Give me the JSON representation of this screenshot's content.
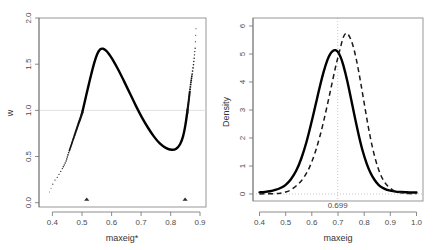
{
  "figure": {
    "background": "#ffffff",
    "panels": 2
  },
  "chart_data": [
    {
      "id": "left-panel",
      "type": "line",
      "title": "",
      "xlabel": "maxeig*",
      "ylabel": "w",
      "xlim": [
        0.355,
        0.915
      ],
      "ylim": [
        -0.07,
        2.07
      ],
      "xticks": [
        "0.4",
        "0.5",
        "0.6",
        "0.7",
        "0.8",
        "0.9"
      ],
      "xtick_values": [
        0.4,
        0.5,
        0.6,
        0.7,
        0.8,
        0.9
      ],
      "yticks": [
        "0.0",
        "0.5",
        "1.0",
        "1.5",
        "2.0"
      ],
      "ytick_values": [
        0.0,
        0.5,
        1.0,
        1.5,
        2.0
      ],
      "grid": false,
      "legend": "none",
      "reference_lines": [
        {
          "orientation": "horizontal",
          "value": 1.0,
          "color": "#d9d9d9",
          "style": "solid"
        }
      ],
      "series": [
        {
          "name": "w",
          "style": "dotted-to-solid",
          "color": "#000000",
          "x": [
            0.39,
            0.398,
            0.406,
            0.414,
            0.422,
            0.43,
            0.438,
            0.446,
            0.452,
            0.458,
            0.464,
            0.47,
            0.476,
            0.482,
            0.488,
            0.494,
            0.5,
            0.51,
            0.52,
            0.53,
            0.54,
            0.55,
            0.56,
            0.57,
            0.58,
            0.59,
            0.6,
            0.62,
            0.64,
            0.66,
            0.68,
            0.7,
            0.72,
            0.74,
            0.76,
            0.78,
            0.8,
            0.815,
            0.828,
            0.838,
            0.846,
            0.852,
            0.857,
            0.861,
            0.864,
            0.867,
            0.87,
            0.873,
            0.876,
            0.879,
            0.882
          ],
          "y": [
            0.1,
            0.165,
            0.225,
            0.255,
            0.3,
            0.345,
            0.395,
            0.45,
            0.52,
            0.58,
            0.64,
            0.7,
            0.76,
            0.82,
            0.88,
            0.935,
            1.0,
            1.145,
            1.29,
            1.43,
            1.56,
            1.66,
            1.715,
            1.722,
            1.7,
            1.66,
            1.61,
            1.49,
            1.355,
            1.215,
            1.075,
            0.945,
            0.83,
            0.73,
            0.65,
            0.6,
            0.578,
            0.59,
            0.64,
            0.73,
            0.86,
            1.0,
            1.13,
            1.25,
            1.33,
            1.4,
            1.47,
            1.54,
            1.64,
            1.74,
            2.01
          ]
        }
      ],
      "markers": [
        {
          "name": "rug-triangle",
          "x": 0.515,
          "y": 0.0,
          "shape": "triangle"
        },
        {
          "name": "rug-triangle",
          "x": 0.845,
          "y": 0.0,
          "shape": "triangle"
        }
      ]
    },
    {
      "id": "right-panel",
      "type": "line",
      "title": "",
      "xlabel": "maxeig",
      "ylabel": "Density",
      "xlim": [
        0.375,
        1.025
      ],
      "ylim": [
        -0.25,
        6.3
      ],
      "xticks": [
        "0.4",
        "0.5",
        "0.6",
        "0.7",
        "0.8",
        "0.9",
        "1.0"
      ],
      "xtick_values": [
        0.4,
        0.5,
        0.6,
        0.7,
        0.8,
        0.9,
        1.0
      ],
      "yticks": [
        "0",
        "1",
        "2",
        "3",
        "4",
        "5",
        "6"
      ],
      "ytick_values": [
        0,
        1,
        2,
        3,
        4,
        5,
        6
      ],
      "grid": false,
      "legend": "none",
      "annotations": [
        {
          "text": "0.699",
          "x": 0.699,
          "y": -0.2
        }
      ],
      "reference_lines": [
        {
          "orientation": "vertical",
          "value": 0.699,
          "color": "#b0b0b0",
          "style": "dotted"
        },
        {
          "orientation": "horizontal",
          "value": 0.0,
          "color": "#b0b0b0",
          "style": "dotted"
        }
      ],
      "series": [
        {
          "name": "density-observed",
          "style": "solid",
          "color": "#000000",
          "x": [
            0.4,
            0.42,
            0.44,
            0.46,
            0.48,
            0.5,
            0.52,
            0.54,
            0.56,
            0.58,
            0.6,
            0.615,
            0.63,
            0.645,
            0.66,
            0.67,
            0.68,
            0.69,
            0.7,
            0.71,
            0.72,
            0.735,
            0.75,
            0.765,
            0.78,
            0.795,
            0.81,
            0.825,
            0.84,
            0.855,
            0.87,
            0.885,
            0.9,
            0.92,
            0.94,
            0.96,
            0.98,
            1.0
          ],
          "y": [
            0.06,
            0.075,
            0.1,
            0.145,
            0.215,
            0.33,
            0.53,
            0.83,
            1.28,
            1.88,
            2.62,
            3.22,
            3.82,
            4.37,
            4.81,
            5.01,
            5.12,
            5.15,
            5.08,
            4.9,
            4.62,
            4.06,
            3.4,
            2.72,
            2.08,
            1.52,
            1.08,
            0.74,
            0.5,
            0.33,
            0.225,
            0.16,
            0.12,
            0.085,
            0.07,
            0.062,
            0.058,
            0.055
          ]
        },
        {
          "name": "density-reference",
          "style": "dashed",
          "color": "#1a1a1a",
          "x": [
            0.4,
            0.43,
            0.46,
            0.48,
            0.5,
            0.52,
            0.54,
            0.555,
            0.57,
            0.585,
            0.6,
            0.615,
            0.63,
            0.645,
            0.66,
            0.675,
            0.69,
            0.7,
            0.71,
            0.72,
            0.73,
            0.74,
            0.755,
            0.77,
            0.785,
            0.8,
            0.815,
            0.83,
            0.845,
            0.86,
            0.875,
            0.89,
            0.91,
            0.93,
            0.95,
            0.975,
            1.0
          ],
          "y": [
            0.005,
            0.008,
            0.015,
            0.03,
            0.07,
            0.15,
            0.29,
            0.42,
            0.6,
            0.84,
            1.16,
            1.56,
            2.04,
            2.6,
            3.22,
            3.87,
            4.52,
            4.9,
            5.27,
            5.6,
            5.75,
            5.7,
            5.38,
            4.82,
            4.08,
            3.26,
            2.45,
            1.74,
            1.18,
            0.76,
            0.47,
            0.29,
            0.14,
            0.07,
            0.035,
            0.015,
            0.008
          ]
        }
      ]
    }
  ]
}
